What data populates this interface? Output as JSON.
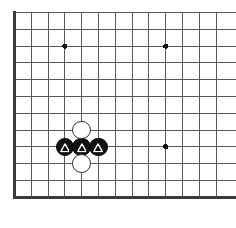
{
  "figure": {
    "kind": "go-board-diagram",
    "board": {
      "columns": 13,
      "rows": 12,
      "cell_size": 16.8,
      "origin_x": 14.5,
      "origin_y": 12.5,
      "line_color": "#585858",
      "edge_color": "#3a3a3a",
      "edge_width": 2.4,
      "line_width": 1.0,
      "background_color": "#ffffff",
      "thick_edges": [
        "left",
        "bottom"
      ]
    },
    "star_points": {
      "color": "#111111",
      "radius": 2.6,
      "points": [
        {
          "name": "star-point-upper-left",
          "col": 3,
          "row": 2
        },
        {
          "name": "star-point-upper-right",
          "col": 9,
          "row": 2
        },
        {
          "name": "star-point-lower-right",
          "col": 9,
          "row": 8
        }
      ]
    },
    "stones": [
      {
        "name": "black-stone-left",
        "color": "black",
        "col": 3,
        "row": 8,
        "marker": "triangle",
        "radius": 9.4
      },
      {
        "name": "black-stone-centre",
        "color": "black",
        "col": 4,
        "row": 8,
        "marker": "triangle",
        "radius": 9.4
      },
      {
        "name": "black-stone-right",
        "color": "black",
        "col": 5,
        "row": 8,
        "marker": "triangle",
        "radius": 9.4
      },
      {
        "name": "white-stone-above",
        "color": "white",
        "col": 4,
        "row": 7,
        "marker": "none",
        "radius": 9.4
      },
      {
        "name": "white-stone-below",
        "color": "white",
        "col": 4,
        "row": 9,
        "marker": "none",
        "radius": 9.4
      }
    ],
    "marker": {
      "shape": "triangle",
      "color": "#ffffff",
      "size": 9.6
    },
    "colors": {
      "black_stone": "#111111",
      "white_stone": "#ffffff",
      "white_stone_outline": "#333333",
      "grid": "#585858",
      "board_edge": "#3a3a3a",
      "star_point": "#111111"
    }
  }
}
